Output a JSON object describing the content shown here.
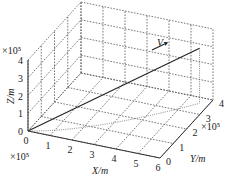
{
  "chart_data": {
    "type": "line3d",
    "title": "",
    "xlabel": "X/m",
    "ylabel": "Y/m",
    "zlabel": "Z/m",
    "x_scale": "×10⁵",
    "y_scale": "×10⁵",
    "z_scale": "×10⁵",
    "x_ticks": [
      "0",
      "1",
      "2",
      "3",
      "4",
      "5",
      "6"
    ],
    "y_ticks": [
      "0",
      "1",
      "2",
      "3",
      "4"
    ],
    "z_ticks": [
      "0",
      "1",
      "2",
      "3",
      "4"
    ],
    "xlim": [
      0,
      6
    ],
    "ylim": [
      0,
      4
    ],
    "zlim": [
      0,
      4
    ],
    "grid": true,
    "series": [
      {
        "name": "trajectory",
        "x": [
          0,
          5.6
        ],
        "y": [
          0,
          3.65
        ],
        "z": [
          0,
          3.1
        ]
      }
    ],
    "annotations": [
      {
        "text": "V",
        "description": "velocity direction arrow along trajectory"
      }
    ],
    "projections": [
      "dotted projection of trajectory onto XY plane",
      "dotted vertical drop line from endpoint"
    ]
  }
}
